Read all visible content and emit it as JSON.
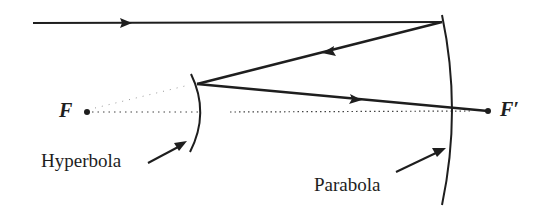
{
  "diagram": {
    "title": "",
    "colors": {
      "ink": "#1e1e1e",
      "background": "#ffffff"
    },
    "labels": {
      "focus_left": "F",
      "focus_right": "F′",
      "hyperbola": "Hyperbola",
      "parabola": "Parabola"
    },
    "elements": [
      {
        "type": "ray",
        "name": "incoming-ray",
        "from": [
          33,
          23
        ],
        "to": [
          442,
          22
        ],
        "arrow_at": [
          125,
          23
        ],
        "direction": "right"
      },
      {
        "type": "mirror",
        "name": "parabola",
        "shape": "arc",
        "top": [
          442,
          15
        ],
        "bottom": [
          442,
          205
        ]
      },
      {
        "type": "ray",
        "name": "reflected-ray",
        "from": [
          442,
          22
        ],
        "to": [
          197,
          84
        ],
        "arrow_at": [
          330,
          51
        ],
        "direction": "left"
      },
      {
        "type": "mirror",
        "name": "hyperbola",
        "shape": "arc",
        "top": [
          191,
          74
        ],
        "bottom": [
          190,
          152
        ]
      },
      {
        "type": "ray",
        "name": "ray-to-focus",
        "from": [
          197,
          84
        ],
        "to": [
          488,
          111
        ],
        "arrow_at": [
          355,
          99
        ],
        "direction": "right"
      },
      {
        "type": "point",
        "name": "focus-F",
        "at": [
          87,
          112
        ]
      },
      {
        "type": "point",
        "name": "focus-F-prime",
        "at": [
          488,
          111
        ]
      },
      {
        "type": "dotted-line",
        "name": "optical-axis",
        "from": [
          90,
          112
        ],
        "to": [
          470,
          112
        ]
      }
    ]
  }
}
